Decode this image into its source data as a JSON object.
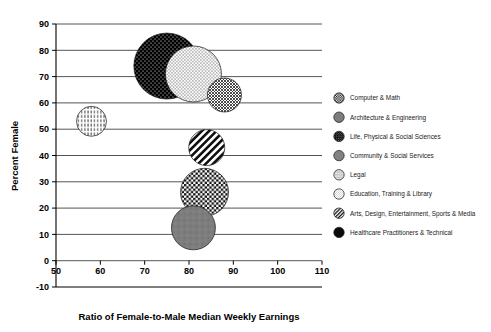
{
  "chart_data": {
    "type": "scatter",
    "subtype": "bubble",
    "title": "",
    "xlabel": "Ratio of Female-to-Male Median Weekly Earnings",
    "ylabel": "Percent Female",
    "xlim": [
      50,
      110
    ],
    "ylim": [
      -10,
      90
    ],
    "xticks": [
      50,
      60,
      70,
      80,
      90,
      100,
      110
    ],
    "yticks": [
      -10,
      0,
      10,
      20,
      30,
      40,
      50,
      60,
      70,
      80,
      90
    ],
    "grid": "horizontal",
    "legend_position": "right",
    "points": [
      {
        "name": "Computer & Math",
        "x": 83.5,
        "y": 26,
        "size": 24,
        "pattern": "checkerboard"
      },
      {
        "name": "Architecture & Engineering",
        "x": 81,
        "y": 12.5,
        "size": 22,
        "pattern": "solid-gray"
      },
      {
        "name": "Life, Physical & Social Sciences",
        "x": 75,
        "y": 74,
        "size": 33,
        "pattern": "black-dotted"
      },
      {
        "name": "Community & Social Services",
        "x": 88,
        "y": 63,
        "size": 17,
        "pattern": "crosshatch"
      },
      {
        "name": "Legal",
        "x": 58,
        "y": 53,
        "size": 15,
        "pattern": "vertical-dash"
      },
      {
        "name": "Education, Training & Library",
        "x": 81,
        "y": 71,
        "size": 28,
        "pattern": "fine-dots"
      },
      {
        "name": "Arts, Design, Entertainment, Sports & Media",
        "x": 84,
        "y": 43,
        "size": 18,
        "pattern": "diagonal-stripe"
      },
      {
        "name": "Healthcare Practitioners & Technical",
        "x": 0,
        "y": 0,
        "size": 0,
        "pattern": "solid-black"
      }
    ],
    "legend": [
      {
        "label": "Computer & Math",
        "pattern": "checkerboard"
      },
      {
        "label": "Architecture & Engineering",
        "pattern": "solid-gray"
      },
      {
        "label": "Life, Physical & Social Sciences",
        "pattern": "black-dotted"
      },
      {
        "label": "Community & Social Services",
        "pattern": "crosshatch"
      },
      {
        "label": "Legal",
        "pattern": "vertical-dash"
      },
      {
        "label": "Education, Training & Library",
        "pattern": "fine-dots"
      },
      {
        "label": "Arts, Design, Entertainment, Sports & Media",
        "pattern": "diagonal-stripe"
      },
      {
        "label": "Healthcare Practitioners & Technical",
        "pattern": "solid-black"
      }
    ],
    "colors": {
      "axis": "#000000",
      "grid": "#555555",
      "gray_fill": "#808080",
      "black_fill": "#000000",
      "background": "#ffffff"
    }
  },
  "axes": {
    "x_title": "Ratio of Female-to-Male Median Weekly Earnings",
    "y_title": "Percent Female",
    "x_tick_labels": [
      "50",
      "60",
      "70",
      "80",
      "90",
      "100",
      "110"
    ],
    "y_tick_labels": [
      "90",
      "80",
      "70",
      "60",
      "50",
      "40",
      "30",
      "20",
      "10",
      "0",
      "-10"
    ]
  },
  "legend": {
    "items": [
      {
        "label": "Computer & Math"
      },
      {
        "label": "Architecture & Engineering"
      },
      {
        "label": "Life, Physical & Social Sciences"
      },
      {
        "label": "Community & Social Services"
      },
      {
        "label": "Legal"
      },
      {
        "label": "Education, Training & Library"
      },
      {
        "label": "Arts, Design, Entertainment, Sports & Media"
      },
      {
        "label": "Healthcare Practitioners & Technical"
      }
    ]
  }
}
